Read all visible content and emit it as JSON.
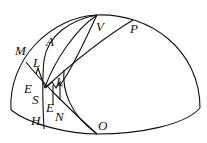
{
  "diagram": {
    "type": "hemisphere-geometry",
    "labels": {
      "M": "M",
      "A": "A",
      "V": "V",
      "P": "P",
      "L1": "L",
      "L2": "L",
      "E1": "E",
      "S": "S",
      "E2": "E",
      "N": "N",
      "H": "H",
      "O": "O"
    },
    "stroke_color": "#111111"
  }
}
